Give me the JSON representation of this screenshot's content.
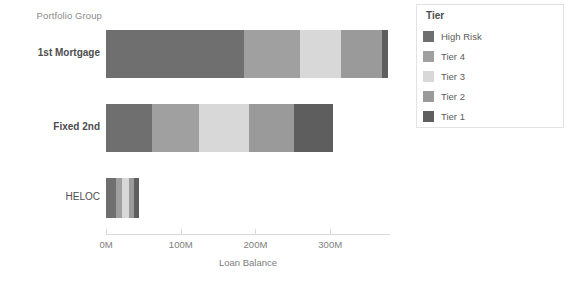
{
  "chart_data": {
    "type": "bar",
    "orientation": "horizontal",
    "stacked": true,
    "title": "",
    "xlabel": "Loan Balance",
    "ylabel": "Portfolio Group",
    "categories": [
      "1st Mortgage",
      "Fixed 2nd",
      "HELOC"
    ],
    "xticklabels": [
      "0M",
      "100M",
      "200M",
      "300M"
    ],
    "xtickvalues": [
      0,
      100,
      200,
      300
    ],
    "xlim": [
      0,
      380
    ],
    "grid": false,
    "legend_title": "Tier",
    "legend_position": "right",
    "series": [
      {
        "name": "High Risk",
        "color": "#6f6f6f",
        "values": [
          185,
          62,
          13
        ]
      },
      {
        "name": "Tier 4",
        "color": "#a0a0a0",
        "values": [
          75,
          62,
          8
        ]
      },
      {
        "name": "Tier 3",
        "color": "#d8d8d8",
        "values": [
          55,
          68,
          10
        ]
      },
      {
        "name": "Tier 2",
        "color": "#9a9a9a",
        "values": [
          55,
          60,
          6
        ]
      },
      {
        "name": "Tier 1",
        "color": "#5e5e5e",
        "values": [
          8,
          52,
          7
        ]
      }
    ],
    "totals": [
      378,
      304,
      44
    ]
  },
  "axis": {
    "y_header": "Portfolio Group",
    "x_title": "Loan Balance"
  },
  "legend": {
    "title": "Tier",
    "items": [
      {
        "label": "High Risk",
        "color": "#6f6f6f"
      },
      {
        "label": "Tier 4",
        "color": "#a0a0a0"
      },
      {
        "label": "Tier 3",
        "color": "#d8d8d8"
      },
      {
        "label": "Tier 2",
        "color": "#9a9a9a"
      },
      {
        "label": "Tier 1",
        "color": "#5e5e5e"
      }
    ]
  }
}
